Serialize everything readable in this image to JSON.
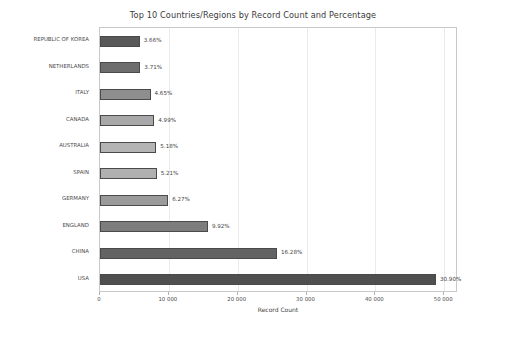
{
  "chart_data": {
    "type": "bar",
    "orientation": "horizontal",
    "title": "Top 10 Countries/Regions by Record Count and Percentage",
    "xlabel": "Record Count",
    "ylabel": "",
    "xlim": [
      0,
      52000
    ],
    "ylim": null,
    "grid": true,
    "legend": null,
    "x_tick_labels": [
      "0",
      "10 000",
      "20 000",
      "30 000",
      "40 000",
      "50 000"
    ],
    "x_tick_values": [
      0,
      10000,
      20000,
      30000,
      40000,
      50000
    ],
    "categories": [
      "REPUBLIC OF KOREA",
      "NETHERLANDS",
      "ITALY",
      "CANADA",
      "AUSTRALIA",
      "SPAIN",
      "GERMANY",
      "ENGLAND",
      "CHINA",
      "USA"
    ],
    "values": [
      5780,
      5860,
      7340,
      7880,
      8180,
      8230,
      9900,
      15670,
      25700,
      48800
    ],
    "annotations": [
      "3.66%",
      "3.71%",
      "4.65%",
      "4.99%",
      "5.18%",
      "5.21%",
      "6.27%",
      "9.92%",
      "16.28%",
      "30.90%"
    ],
    "percentages": [
      3.66,
      3.71,
      4.65,
      4.99,
      5.18,
      5.21,
      6.27,
      9.92,
      16.28,
      30.9
    ],
    "bar_colors": [
      "#595959",
      "#6d6d6d",
      "#8e8e8e",
      "#a8a8a8",
      "#b4b4b4",
      "#b0b0b0",
      "#9a9a9a",
      "#7d7d7d",
      "#636363",
      "#4f4f4f"
    ],
    "bar_edge_color": "#4a4a4a",
    "grid_color": "#eaeaea",
    "axis_color": "#c9c9c9",
    "text_color": "#4c4c4c",
    "background_color": "#ffffff"
  }
}
